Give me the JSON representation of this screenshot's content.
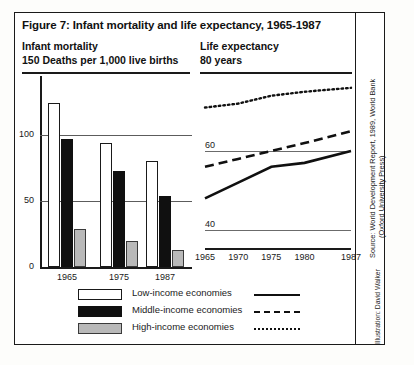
{
  "figure": {
    "title": "Figure 7: Infant mortality and life expectancy, 1965-1987",
    "left_heading_1": "Infant mortality",
    "left_heading_2": "150 Deaths per 1,000 live births",
    "right_heading_1": "Life expectancy",
    "right_heading_2": "80 years",
    "source_line_1": "Source: World Development Report, 1989, World Bank",
    "source_line_2": "(Oxford University Press)",
    "illustration": "Illustration: David Walker"
  },
  "legend": {
    "items": [
      {
        "label": "Low-income economies",
        "swatch": "white-box",
        "line": "solid"
      },
      {
        "label": "Middle-income economies",
        "swatch": "black-box",
        "line": "dashed"
      },
      {
        "label": "High-income economies",
        "swatch": "grey-box",
        "line": "dotted"
      }
    ]
  },
  "chart_data": [
    {
      "type": "bar",
      "title": "Infant mortality",
      "ylabel": "150 Deaths per 1,000 live births",
      "xlabel": "",
      "categories": [
        "1965",
        "1975",
        "1987"
      ],
      "yticks": [
        "0",
        "50",
        "100"
      ],
      "ytick_values": [
        0,
        50,
        100
      ],
      "ylim": [
        0,
        150
      ],
      "grid": true,
      "series": [
        {
          "name": "Low-income economies",
          "values": [
            124,
            94,
            80
          ]
        },
        {
          "name": "Middle-income economies",
          "values": [
            97,
            73,
            54
          ]
        },
        {
          "name": "High-income economies",
          "values": [
            29,
            20,
            13
          ]
        }
      ]
    },
    {
      "type": "line",
      "title": "Life expectancy",
      "ylabel": "80 years",
      "xlabel": "",
      "x": [
        1965,
        1970,
        1975,
        1980,
        1987
      ],
      "xticks": [
        "1965",
        "1970",
        "1975",
        "1980",
        "1987"
      ],
      "yticks": [
        "40",
        "60",
        "80"
      ],
      "ytick_values": [
        40,
        60,
        80
      ],
      "ylim": [
        32,
        80
      ],
      "grid": true,
      "legend_position": "bottom",
      "series": [
        {
          "name": "Low-income economies",
          "style": "solid",
          "values": [
            48,
            52,
            56,
            57,
            60
          ]
        },
        {
          "name": "Middle-income economies",
          "style": "dashed",
          "values": [
            56,
            58,
            60,
            62,
            65
          ]
        },
        {
          "name": "High-income economies",
          "style": "dotted",
          "values": [
            71,
            72,
            74,
            75,
            76
          ]
        }
      ]
    }
  ],
  "colors": {
    "low_income": "#ffffff",
    "middle_income": "#101010",
    "high_income": "#b9b9b9",
    "axis": "#1a1a1a",
    "grid": "#5c5c5c"
  }
}
